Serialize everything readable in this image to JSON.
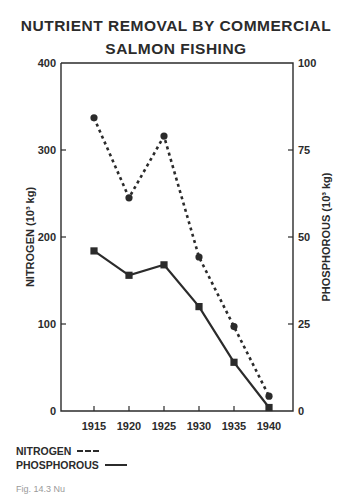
{
  "title": {
    "line1": "NUTRIENT REMOVAL BY COMMERCIAL",
    "line2": "SALMON FISHING"
  },
  "axes": {
    "left": {
      "label": "NITROGEN (10³ kg)",
      "ticks": [
        "0",
        "100",
        "200",
        "300",
        "400"
      ]
    },
    "right": {
      "label": "PHOSPHOROUS (10³ kg)",
      "ticks": [
        "0",
        "25",
        "50",
        "75",
        "100"
      ]
    },
    "x": {
      "ticks": [
        "1915",
        "1920",
        "1925",
        "1930",
        "1935",
        "1940"
      ]
    }
  },
  "legend": {
    "nitrogen": "NITROGEN",
    "phosphorous": "PHOSPHOROUS"
  },
  "caption": "Fig. 14.3 Nu",
  "chart_data": {
    "type": "line",
    "x": [
      1915,
      1920,
      1925,
      1930,
      1935,
      1940
    ],
    "xlabel": "",
    "series": [
      {
        "name": "NITROGEN",
        "axis": "left",
        "style": "dashed",
        "marker": "circle",
        "values": [
          337,
          245,
          316,
          177,
          97,
          17
        ]
      },
      {
        "name": "PHOSPHOROUS",
        "axis": "right",
        "style": "solid",
        "marker": "square",
        "values": [
          46,
          39,
          42,
          30,
          14,
          1
        ]
      }
    ],
    "ylabel": "NITROGEN (10³ kg)",
    "ylim": [
      0,
      400
    ],
    "y2label": "PHOSPHOROUS (10³ kg)",
    "y2lim": [
      0,
      100
    ],
    "grid": false,
    "legend_position": "bottom-left, below plot"
  }
}
